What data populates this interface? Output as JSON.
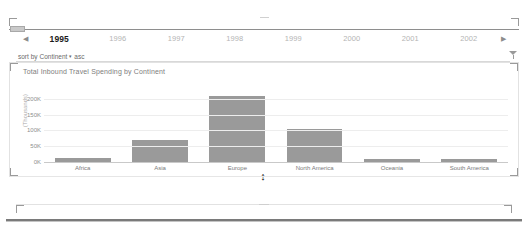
{
  "year_filter": {
    "prev_label": "◀",
    "next_label": "▶",
    "years": [
      "1995",
      "1996",
      "1997",
      "1998",
      "1999",
      "2000",
      "2001",
      "2002"
    ],
    "selected_year": "1995"
  },
  "sort_control": {
    "prefix_label": "sort by",
    "field_label": "Continent",
    "caret": "▾",
    "direction_label": "asc"
  },
  "filter": {
    "icon_name": "filter-funnel-icon"
  },
  "chart_panel": {
    "title": "Total Inbound Travel Spending by Continent",
    "resize_handle_glyph": "↕"
  },
  "chart_data": {
    "type": "bar",
    "title": "Total Inbound Travel Spending by Continent",
    "xlabel": "",
    "ylabel": "(Thousands)",
    "categories": [
      "Africa",
      "Asia",
      "Europe",
      "North America",
      "Oceania",
      "South America"
    ],
    "values": [
      12000,
      70000,
      210000,
      105000,
      9000,
      9000
    ],
    "tick_labels": [
      "0K",
      "50K",
      "100K",
      "150K",
      "200K"
    ],
    "tick_values": [
      0,
      50000,
      100000,
      150000,
      200000
    ],
    "ylim": [
      0,
      215000
    ],
    "grid": true,
    "legend": "none",
    "bar_color": "#9a9a9a"
  },
  "colors": {
    "bar": "#9a9a9a",
    "grid": "#ededed",
    "axis": "#c9c9c9",
    "selected_year_text": "#1a1a1a",
    "muted_text": "#b4b4b4"
  }
}
